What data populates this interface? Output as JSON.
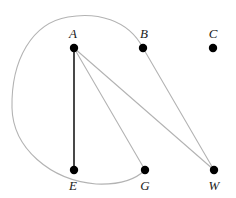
{
  "figure": {
    "kind": "undirected-graph-drawing",
    "width": 236,
    "height": 198,
    "background_color": "#ffffff"
  },
  "style": {
    "vertex_color": "#000000",
    "vertex_radius": 4.2,
    "edge_color_light": "#b3b3b3",
    "edge_color_dark": "#1a1a1a",
    "edge_width_light": 1.1,
    "edge_width_dark": 1.6,
    "label_color": "#1a1a1a",
    "label_font_size": "13px"
  },
  "chart_data": {
    "type": "scatter",
    "title": "",
    "xlabel": "",
    "ylabel": "",
    "vertices": [
      {
        "id": "A",
        "label": "A",
        "x": 74,
        "y": 48,
        "label_x": 73,
        "label_y": 38,
        "label_pos": "above"
      },
      {
        "id": "B",
        "label": "B",
        "x": 143,
        "y": 48,
        "label_x": 144,
        "label_y": 38,
        "label_pos": "above"
      },
      {
        "id": "C",
        "label": "C",
        "x": 213,
        "y": 48,
        "label_x": 213,
        "label_y": 38,
        "label_pos": "above"
      },
      {
        "id": "E",
        "label": "E",
        "x": 74,
        "y": 170,
        "label_x": 73,
        "label_y": 190,
        "label_pos": "below"
      },
      {
        "id": "G",
        "label": "G",
        "x": 145,
        "y": 170,
        "label_x": 145,
        "label_y": 190,
        "label_pos": "below"
      },
      {
        "id": "W",
        "label": "W",
        "x": 214,
        "y": 170,
        "label_x": 214,
        "label_y": 190,
        "label_pos": "below"
      }
    ],
    "edges": [
      {
        "id": "A-E",
        "from": "A",
        "to": "E",
        "shape": "line",
        "color": "#1a1a1a",
        "width": 1.6,
        "path": "M 74 48 L 74 170"
      },
      {
        "id": "A-G",
        "from": "A",
        "to": "G",
        "shape": "line",
        "color": "#b3b3b3",
        "width": 1.1,
        "path": "M 74 48 L 145 170"
      },
      {
        "id": "A-W",
        "from": "A",
        "to": "W",
        "shape": "line",
        "color": "#b3b3b3",
        "width": 1.1,
        "path": "M 74 48 L 214 170"
      },
      {
        "id": "B-W",
        "from": "B",
        "to": "W",
        "shape": "line",
        "color": "#b3b3b3",
        "width": 1.1,
        "path": "M 143 48 L 214 170"
      },
      {
        "id": "B-G",
        "from": "B",
        "to": "G",
        "shape": "curve",
        "color": "#b3b3b3",
        "width": 1.1,
        "path": "M 143 48 C 128 19 96 12 68 17 C 32 23 11 60 12 108 C 13 148 50 180 96 184 C 120 185 136 179 145 170"
      }
    ],
    "isolated_vertices": [
      "C"
    ],
    "legend": [],
    "annotations": []
  }
}
